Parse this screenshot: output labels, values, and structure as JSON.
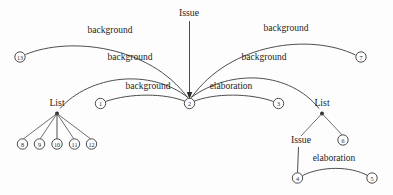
{
  "diagram": {
    "background_color": "#fdfdfd",
    "stroke_color": "#3a3a3a",
    "text_color": "#1d1d1d"
  },
  "schema_labels": {
    "top_issue": "Issue",
    "left_list": "List",
    "right_list": "List",
    "right_issue": "Issue"
  },
  "relation_labels": {
    "bg_outer_left": "background",
    "bg_outer_right": "background",
    "bg_mid_left": "background",
    "bg_mid_right": "background",
    "bg_inner_left": "background",
    "elab_inner_right": "elaboration",
    "elab_bottom_right": "elaboration"
  },
  "nodes": [
    {
      "id": "n1",
      "label": "1",
      "cx": 100.5,
      "cy": 103.5,
      "r": 5.2
    },
    {
      "id": "n2",
      "label": "2",
      "cx": 189.5,
      "cy": 103.5,
      "r": 5.2
    },
    {
      "id": "n3",
      "label": "3",
      "cx": 278.5,
      "cy": 103.5,
      "r": 5.2
    },
    {
      "id": "n4",
      "label": "4",
      "cx": 297.5,
      "cy": 178.0,
      "r": 5.2
    },
    {
      "id": "n5",
      "label": "5",
      "cx": 372.0,
      "cy": 178.0,
      "r": 5.2
    },
    {
      "id": "n6",
      "label": "6",
      "cx": 343.0,
      "cy": 140.0,
      "r": 5.2
    },
    {
      "id": "n7",
      "label": "7",
      "cx": 361.0,
      "cy": 57.0,
      "r": 5.2
    },
    {
      "id": "n8",
      "label": "8",
      "cx": 22.5,
      "cy": 144.0,
      "r": 5.2
    },
    {
      "id": "n9",
      "label": "9",
      "cx": 39.5,
      "cy": 144.0,
      "r": 5.2
    },
    {
      "id": "n10",
      "label": "10",
      "cx": 57.0,
      "cy": 144.0,
      "r": 5.2
    },
    {
      "id": "n11",
      "label": "11",
      "cx": 74.5,
      "cy": 144.0,
      "r": 5.2
    },
    {
      "id": "n12",
      "label": "12",
      "cx": 91.5,
      "cy": 144.0,
      "r": 5.2
    },
    {
      "id": "n13",
      "label": "13",
      "cx": 20.0,
      "cy": 57.0,
      "r": 5.2
    }
  ],
  "label_positions": {
    "bg_outer_left": {
      "x": 110,
      "y": 33
    },
    "bg_outer_right": {
      "x": 286,
      "y": 31
    },
    "bg_mid_left": {
      "x": 130,
      "y": 60
    },
    "bg_mid_right": {
      "x": 264,
      "y": 60
    },
    "bg_inner_left": {
      "x": 148,
      "y": 89
    },
    "elab_inner_right": {
      "x": 231,
      "y": 89
    },
    "elab_bottom_right": {
      "x": 334,
      "y": 161
    },
    "top_issue": {
      "x": 189,
      "y": 16
    },
    "left_list": {
      "x": 57,
      "y": 106
    },
    "right_list": {
      "x": 322,
      "y": 106
    },
    "right_issue": {
      "x": 301,
      "y": 143
    }
  }
}
